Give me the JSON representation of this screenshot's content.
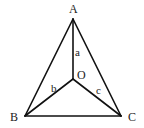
{
  "diagram": {
    "type": "geometry-figure",
    "vertices": {
      "A": "A",
      "B": "B",
      "C": "C",
      "O": "O"
    },
    "segment_labels": {
      "OA": "a",
      "OB": "b",
      "OC": "c"
    },
    "edges": [
      "AB",
      "BC",
      "CA",
      "OA",
      "OB",
      "OC"
    ],
    "line_color": "#111111",
    "background": "#ffffff"
  }
}
